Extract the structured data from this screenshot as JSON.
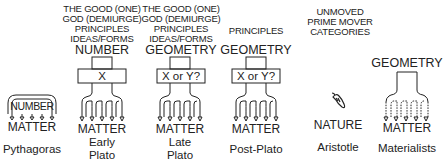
{
  "columns": [
    {
      "name": "Pythagoras",
      "top_lines": [],
      "principle": "NUMBER",
      "box_label": "",
      "base": "MATTER",
      "caption": [
        "Pythagoras"
      ]
    },
    {
      "name": "Early Plato",
      "top_lines": [
        "THE GOOD (ONE)",
        "GOD (DEMIURGE)",
        "PRINCIPLES",
        "IDEAS/FORMS"
      ],
      "principle": "NUMBER",
      "box_label": "X",
      "base": "MATTER",
      "caption": [
        "Early",
        "Plato"
      ]
    },
    {
      "name": "Late Plato",
      "top_lines": [
        "THE GOOD (ONE)",
        "GOD (DEMIURGE)",
        "PRINCIPLES",
        "IDEAS/FORMS"
      ],
      "principle": "GEOMETRY",
      "box_label": "X or Y?",
      "base": "MATTER",
      "caption": [
        "Late",
        "Plato"
      ]
    },
    {
      "name": "Post-Plato",
      "top_lines": [
        "PRINCIPLES"
      ],
      "principle": "GEOMETRY",
      "box_label": "X or Y?",
      "base": "MATTER",
      "caption": [
        "Post-Plato"
      ]
    },
    {
      "name": "Aristotle",
      "top_lines": [
        "UNMOVED",
        "PRIME MOVER",
        "CATEGORIES"
      ],
      "principle": "",
      "box_label": "",
      "base": "NATURE",
      "caption": [
        "Aristotle"
      ]
    },
    {
      "name": "Materialists",
      "top_lines": [],
      "principle": "GEOMETRY",
      "box_label": "",
      "base": "MATTER",
      "caption": [
        "Materialists"
      ]
    }
  ],
  "icons": {
    "aristotle": "seed-pod-icon"
  }
}
